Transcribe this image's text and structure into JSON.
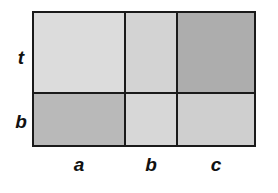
{
  "diagram": {
    "type": "area-model-grid",
    "row_labels": [
      "t",
      "b"
    ],
    "column_labels": [
      "a",
      "b",
      "c"
    ],
    "cells": [
      {
        "row": "t",
        "col": "a",
        "shade": "#dcdcdc"
      },
      {
        "row": "t",
        "col": "b",
        "shade": "#d3d3d3"
      },
      {
        "row": "t",
        "col": "c",
        "shade": "#adadad"
      },
      {
        "row": "b",
        "col": "a",
        "shade": "#b9b9b9"
      },
      {
        "row": "b",
        "col": "b",
        "shade": "#d7d7d7"
      },
      {
        "row": "b",
        "col": "c",
        "shade": "#cfcfcf"
      }
    ],
    "border_color": "#1a1a1a"
  }
}
